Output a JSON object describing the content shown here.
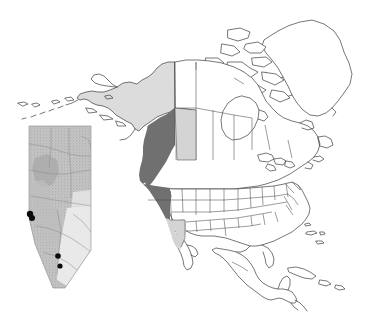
{
  "figure": {
    "name": "north-america-study-area-map",
    "width": 378,
    "height": 324,
    "background_color": "#ffffff",
    "has_title": false,
    "has_legend": false,
    "has_scalebar": false,
    "has_north_arrow": false,
    "has_graticule": false,
    "has_axis_labels": false
  },
  "colors": {
    "land_fill": "#ffffff",
    "coastline_stroke": "#3c3c3c",
    "boundary_stroke": "#4a4a4a",
    "highlight_dark": "#707070",
    "highlight_light": "#d4d4d4",
    "inset_frame_stroke": "#8c8c8c",
    "inset_base_fill": "#c9c9c9",
    "inset_marker_fill": "#0b0b0b"
  },
  "basemap": {
    "name": "north-america-outline",
    "projection_note": "conic, north up",
    "regions_outlined": [
      "Greenland",
      "Canada",
      "United States",
      "Mexico",
      "Alaska",
      "Canadian Arctic Archipelago",
      "Cuba",
      "Bahamas",
      "Aleutian Islands",
      "Vancouver Island",
      "Newfoundland",
      "Baja California",
      "Yucatan Peninsula",
      "Hudson Bay",
      "Great Lakes"
    ]
  },
  "highlighted_regions": [
    {
      "id": "british-columbia",
      "label": "British Columbia",
      "shade": "dark",
      "fill": "#707070"
    },
    {
      "id": "washington",
      "label": "Washington",
      "shade": "dark",
      "fill": "#707070"
    },
    {
      "id": "oregon",
      "label": "Oregon",
      "shade": "dark",
      "fill": "#707070"
    },
    {
      "id": "alberta",
      "label": "Alberta",
      "shade": "light",
      "fill": "#d4d4d4"
    },
    {
      "id": "california",
      "label": "California",
      "shade": "light",
      "fill": "#d4d4d4"
    },
    {
      "id": "alaska",
      "label": "Alaska",
      "shade": "light",
      "fill": "#dcdcdc"
    }
  ],
  "inset": {
    "name": "alberta-inset",
    "label": "Alberta",
    "frame": {
      "x": 13,
      "y": 122,
      "width": 84,
      "height": 168
    },
    "surface_note": "shaded relief / stippled terrain fill with interior drainage and boundary lines",
    "markers": [
      {
        "id": "site-1",
        "x": 17,
        "y": 92,
        "shape": "filled-circle"
      },
      {
        "id": "site-2",
        "x": 19,
        "y": 96,
        "shape": "filled-circle"
      },
      {
        "id": "site-3",
        "x": 45,
        "y": 134,
        "shape": "filled-circle"
      },
      {
        "id": "site-4",
        "x": 47,
        "y": 144,
        "shape": "filled-circle"
      }
    ],
    "marker_count": 4
  }
}
